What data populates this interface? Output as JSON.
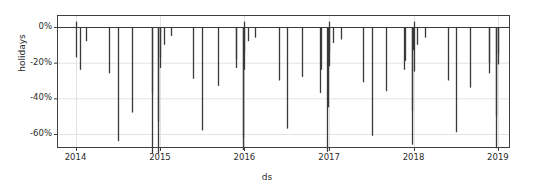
{
  "chart_data": {
    "type": "bar",
    "title": "",
    "xlabel": "ds",
    "ylabel": "holidays",
    "grid": true,
    "legend": null,
    "ylim": [
      -72,
      6
    ],
    "xlim": [
      "2013-10-15",
      "2019-02-20"
    ],
    "ytick_labels": [
      "0%",
      "-20%",
      "-40%",
      "-60%"
    ],
    "ytick_values": [
      0,
      -20,
      -40,
      -60
    ],
    "xtick_labels": [
      "2014",
      "2015",
      "2016",
      "2017",
      "2018",
      "2019"
    ],
    "xtick_values": [
      "2014-01-01",
      "2015-01-01",
      "2016-01-01",
      "2017-01-01",
      "2018-01-01",
      "2019-01-01"
    ],
    "units": "percent",
    "series_name": "holidays",
    "bar_color": "#3a3a3a",
    "grid_color": "#e3e3e3",
    "axis_color": "#3f3f3f",
    "background_color": "#ffffff",
    "x": [
      "2014-01-01",
      "2014-01-20",
      "2014-02-17",
      "2014-05-26",
      "2014-07-04",
      "2014-09-01",
      "2014-11-27",
      "2014-11-28",
      "2014-12-24",
      "2014-12-25",
      "2014-12-31",
      "2015-01-01",
      "2015-01-19",
      "2015-02-16",
      "2015-05-25",
      "2015-07-03",
      "2015-09-07",
      "2015-11-26",
      "2015-11-27",
      "2015-12-24",
      "2015-12-25",
      "2015-12-31",
      "2016-01-01",
      "2016-01-18",
      "2016-02-15",
      "2016-05-30",
      "2016-07-04",
      "2016-09-05",
      "2016-11-24",
      "2016-11-25",
      "2016-12-24",
      "2016-12-26",
      "2016-12-31",
      "2017-01-02",
      "2017-01-16",
      "2017-02-20",
      "2017-05-29",
      "2017-07-04",
      "2017-09-04",
      "2017-11-23",
      "2017-11-24",
      "2017-12-25",
      "2017-12-26",
      "2017-12-31",
      "2018-01-01",
      "2018-01-15",
      "2018-02-19",
      "2018-05-28",
      "2018-07-04",
      "2018-09-03",
      "2018-11-22",
      "2018-11-23",
      "2018-12-24",
      "2018-12-25",
      "2018-12-31",
      "2019-01-01"
    ],
    "values": [
      -17,
      -24,
      -8,
      -26,
      -64,
      -48,
      -71,
      -37,
      -71,
      -53,
      -17,
      -23,
      -10,
      -5,
      -29,
      -58,
      -33,
      -23,
      -18,
      -62,
      -69,
      -14,
      -24,
      -8,
      -6,
      -30,
      -57,
      -28,
      -37,
      -24,
      -70,
      -45,
      -14,
      -22,
      -9,
      -7,
      -31,
      -61,
      -36,
      -24,
      -19,
      -66,
      -47,
      -13,
      -25,
      -10,
      -6,
      -30,
      -59,
      -34,
      -26,
      -20,
      -68,
      -50,
      -15,
      -21
    ],
    "positive_spikes": [
      {
        "x": "2014-01-01",
        "value": 3
      },
      {
        "x": "2016-01-01",
        "value": 3
      },
      {
        "x": "2017-01-01",
        "value": 3
      },
      {
        "x": "2018-01-01",
        "value": 3
      }
    ],
    "note": "Prophet holiday component plot: negative percentage effects rendered as downward vertical lines from the 0% baseline."
  },
  "axes": {
    "ylabel": "holidays",
    "xlabel": "ds"
  }
}
